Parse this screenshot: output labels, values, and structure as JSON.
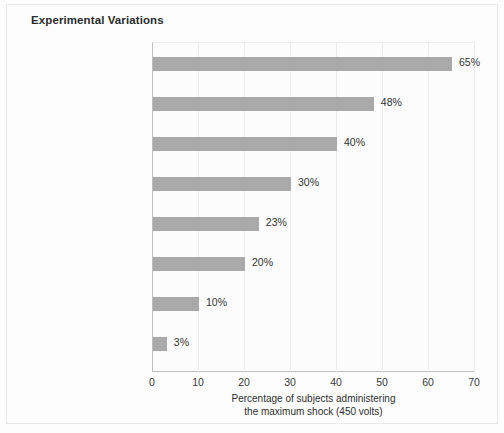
{
  "chart_data": {
    "type": "bar",
    "orientation": "horizontal",
    "title": "Experimental Variations",
    "xlabel_line1": "Percentage of subjects administering",
    "xlabel_line2": "the maximum shock (450 volts)",
    "ylabel": "",
    "xlim": [
      0,
      70
    ],
    "xticks": [
      0,
      10,
      20,
      30,
      40,
      50,
      60,
      70
    ],
    "grid": "vertical-only",
    "legend": "none",
    "bar_color": "#a9a9a9",
    "categories": [
      "Original study",
      "Experiment conducted in office building instead of university setting",
      "Teacher and learner in same room",
      "Teacher required to force learner's hand down on a “shock plate”",
      "Experimenter leaves lab-oratory and gives orders over the phone",
      "Experimenter leaves and ordinary man gives orders to continue",
      "Teacher observes two other teachers rebel and refuse to continue",
      "Teacher free to choose shock level"
    ],
    "values": [
      65,
      48,
      40,
      30,
      23,
      20,
      10,
      3
    ],
    "data_labels": [
      "65%",
      "48%",
      "40%",
      "30%",
      "23%",
      "20%",
      "10%",
      "3%"
    ]
  },
  "rows": [
    {
      "label_lines": [
        "Original study"
      ],
      "value": 65,
      "data_label": "65%"
    },
    {
      "label_lines": [
        "Experiment conducted in",
        "office building instead of",
        "university setting"
      ],
      "value": 48,
      "data_label": "48%"
    },
    {
      "label_lines": [
        "Teacher and learner in",
        "same room"
      ],
      "value": 40,
      "data_label": "40%"
    },
    {
      "label_lines": [
        "Teacher required to force",
        "learner’s hand down on",
        "a “shock plate”"
      ],
      "value": 30,
      "data_label": "30%"
    },
    {
      "label_lines": [
        "Experimenter leaves lab-",
        "oratory and gives orders",
        "over the phone"
      ],
      "value": 23,
      "data_label": "23%"
    },
    {
      "label_lines": [
        "Experimenter leaves and",
        "ordinary man gives",
        "orders to continue"
      ],
      "value": 20,
      "data_label": "20%"
    },
    {
      "label_lines": [
        "Teacher observes two",
        "other teachers rebel and",
        "refuse to continue"
      ],
      "value": 10,
      "data_label": "10%"
    },
    {
      "label_lines": [
        "Teacher free to choose",
        "shock level"
      ],
      "value": 3,
      "data_label": "3%"
    }
  ],
  "axis": {
    "ticks": [
      "0",
      "10",
      "20",
      "30",
      "40",
      "50",
      "60",
      "70"
    ],
    "title_line1": "Percentage of subjects administering",
    "title_line2": "the maximum shock (450 volts)"
  }
}
